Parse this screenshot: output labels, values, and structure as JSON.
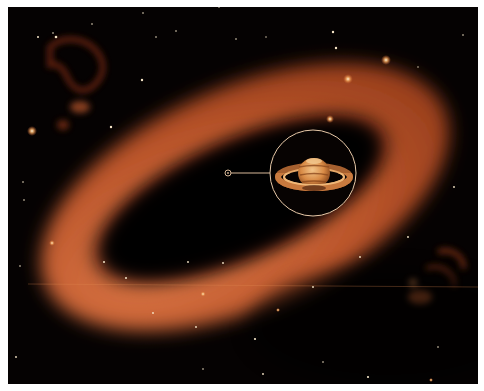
{
  "image": {
    "subject": "Infrared view of a giant dusty ring around Saturn with a circular inset showing the planet",
    "background_color": "#050202",
    "ring_color": "#c0582c",
    "ring_highlight": "#e0794a",
    "inset_border_color": "#e8c9a8"
  },
  "inset": {
    "label": "saturn-inset",
    "center": [
      305,
      166
    ],
    "radius": 43
  },
  "marker": {
    "center": [
      220,
      166
    ],
    "radius": 3
  }
}
